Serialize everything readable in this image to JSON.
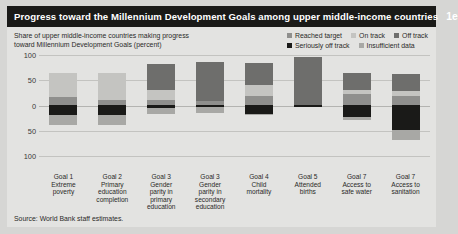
{
  "title": {
    "text": "Progress toward the Millennium Development Goals among upper middle-income countries",
    "number": "1e"
  },
  "subtitle": "Share of upper middle-income countries making progress\ntoward Millennium Development Goals (percent)",
  "source": "Source: World Bank staff estimates.",
  "colors": {
    "reached_target": "#8f8f8d",
    "on_track": "#c4c4c1",
    "off_track": "#6e6e6c",
    "seriously_off_track": "#1a1a18",
    "insufficient_data": "#a8a8a5",
    "background": "#e3e3e1",
    "titlebar": "#1a1a18",
    "page": "#d6d6d4",
    "gridline": "#c3c3c0"
  },
  "legend": {
    "rows": [
      [
        {
          "label": "Reached target",
          "key": "reached_target"
        },
        {
          "label": "On track",
          "key": "on_track"
        },
        {
          "label": "Off track",
          "key": "off_track"
        }
      ],
      [
        {
          "label": "Seriously off track",
          "key": "seriously_off_track"
        },
        {
          "label": "Insufficient data",
          "key": "insufficient_data"
        }
      ]
    ]
  },
  "chart_data": {
    "type": "bar",
    "subtype": "diverging-stacked-bar",
    "title": "Progress toward the Millennium Development Goals among upper middle-income countries",
    "xlabel": "",
    "ylabel": "Share of upper middle-income countries making progress toward Millennium Development Goals (percent)",
    "ylim": [
      -100,
      100
    ],
    "yticks": [
      100,
      50,
      0,
      -50,
      -100
    ],
    "ytick_labels": [
      "100",
      "50",
      "0",
      "50",
      "100"
    ],
    "grid": true,
    "legend_position": "top-right",
    "categories": [
      "Goal 1\nExtreme\npoverty",
      "Goal 2\nPrimary\neducation\ncompletion",
      "Goal 3\nGender\nparity in\nprimary\neducation",
      "Goal 3\nGender\nparity in\nsecondary\neducation",
      "Goal 4\nChild\nmortality",
      "Goal 5\nAttended\nbirths",
      "Goal 7\nAccess to\nsafe water",
      "Goal 7\nAccess to\nsanitation"
    ],
    "series": [
      {
        "name": "Reached target",
        "key": "reached_target",
        "values": [
          17,
          10,
          10,
          8,
          18,
          1,
          22,
          18
        ]
      },
      {
        "name": "On track",
        "key": "on_track",
        "values": [
          47,
          55,
          20,
          0,
          22,
          0,
          8,
          10
        ]
      },
      {
        "name": "Off track",
        "key": "off_track",
        "values": [
          0,
          0,
          52,
          78,
          44,
          96,
          34,
          34
        ]
      },
      {
        "name": "Seriously off track",
        "key": "seriously_off_track",
        "values": [
          -18,
          -18,
          -6,
          -4,
          -16,
          -4,
          -22,
          -48
        ]
      },
      {
        "name": "Insufficient data",
        "key": "insufficient_data",
        "values": [
          -20,
          -20,
          -10,
          -10,
          -2,
          0,
          -6,
          -20
        ]
      }
    ],
    "stack_order_positive": [
      "reached_target",
      "on_track",
      "off_track"
    ],
    "stack_order_negative": [
      "seriously_off_track",
      "insufficient_data"
    ]
  }
}
